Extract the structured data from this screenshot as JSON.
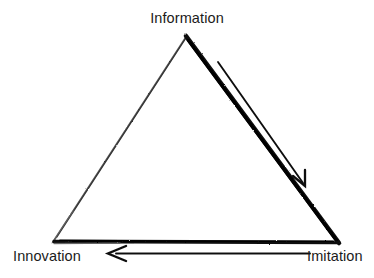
{
  "diagram": {
    "style": "hand-drawn brush stroke triangle",
    "background_color": "#ffffff",
    "stroke_color": "#111111",
    "vertices": [
      {
        "id": "information",
        "label": "Information",
        "position": "top",
        "x": 186,
        "y": 35
      },
      {
        "id": "innovation",
        "label": "Innovation",
        "position": "bottom-left",
        "x": 52,
        "y": 243
      },
      {
        "id": "imitation",
        "label": "Imitation",
        "position": "bottom-right",
        "x": 338,
        "y": 243
      }
    ],
    "edges": [
      {
        "id": "left-edge",
        "from": "innovation",
        "to": "information",
        "weight": "thin"
      },
      {
        "id": "right-edge",
        "from": "information",
        "to": "imitation",
        "weight": "thick"
      },
      {
        "id": "bottom-edge",
        "from": "innovation",
        "to": "imitation",
        "weight": "medium"
      }
    ],
    "arrows": [
      {
        "id": "information-to-imitation",
        "from": "information",
        "to": "imitation",
        "direction": "down-right",
        "head_style": "open-v"
      },
      {
        "id": "imitation-to-innovation",
        "from": "imitation",
        "to": "innovation",
        "direction": "left",
        "head_style": "open-v"
      }
    ]
  }
}
